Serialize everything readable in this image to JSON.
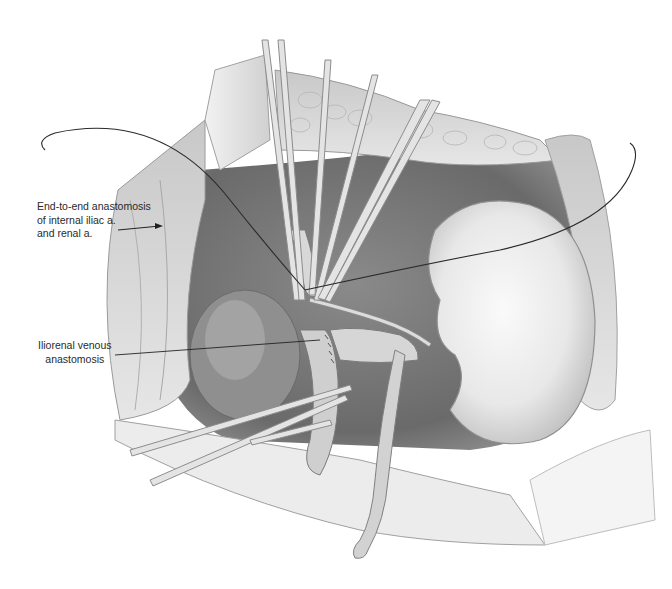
{
  "figure": {
    "palette": {
      "background": "#ffffff",
      "tissue_dark": "#6e6e6e",
      "tissue_mid": "#a8a8a8",
      "tissue_light": "#dedede",
      "kidney": "#efefef",
      "line": "#2a2a2a"
    }
  },
  "labels": {
    "arterial": {
      "line1": "End-to-end anastomosis",
      "line2": "of internal iliac a.",
      "line3": "and renal a."
    },
    "venous": {
      "line1": "Iliorenal venous",
      "line2": "anastomosis"
    }
  }
}
